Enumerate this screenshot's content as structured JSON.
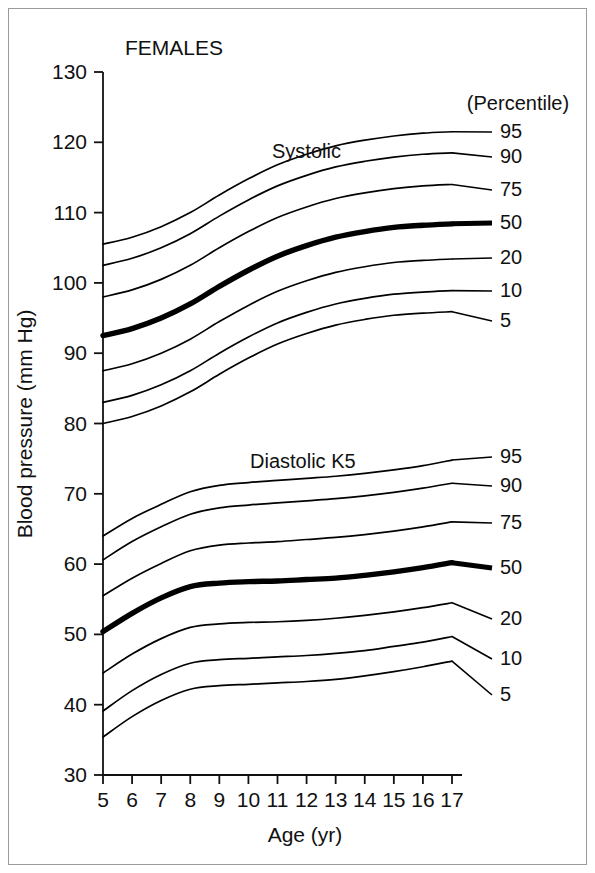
{
  "figure": {
    "panel_label": "FEMALES",
    "legend_title": "(Percentile)"
  },
  "axes": {
    "y_title": "Blood pressure (mm Hg)",
    "x_title": "Age (yr)",
    "y_ticks": [
      30,
      40,
      50,
      60,
      70,
      80,
      90,
      100,
      110,
      120,
      130
    ],
    "x_ticks": [
      5,
      6,
      7,
      8,
      9,
      10,
      11,
      12,
      13,
      14,
      15,
      16,
      17
    ],
    "ylim": [
      30,
      130
    ],
    "xlim": [
      5,
      17
    ],
    "grid": false
  },
  "chart_data": {
    "type": "line",
    "title": "FEMALES",
    "subtitle": "",
    "xlabel": "Age (yr)",
    "ylabel": "Blood pressure (mm Hg)",
    "xlim": [
      5,
      17
    ],
    "ylim": [
      30,
      130
    ],
    "grid": false,
    "legend_position": "right",
    "legend_title": "(Percentile)",
    "x": [
      5,
      6,
      7,
      8,
      9,
      10,
      11,
      12,
      13,
      14,
      15,
      16,
      17
    ],
    "groups": [
      {
        "name": "Systolic",
        "label": "Systolic",
        "series": [
          {
            "name": "95",
            "percentile": 95,
            "emphasis": false,
            "values": [
              105.5,
              106.5,
              108.0,
              110.0,
              112.5,
              114.8,
              116.8,
              118.3,
              119.5,
              120.3,
              120.9,
              121.3,
              121.5
            ]
          },
          {
            "name": "90",
            "percentile": 90,
            "emphasis": false,
            "values": [
              102.5,
              103.5,
              105.0,
              107.0,
              109.5,
              111.8,
              113.8,
              115.3,
              116.5,
              117.3,
              117.9,
              118.3,
              118.5
            ]
          },
          {
            "name": "75",
            "percentile": 75,
            "emphasis": false,
            "values": [
              98.0,
              99.0,
              100.5,
              102.5,
              105.0,
              107.3,
              109.3,
              110.8,
              112.0,
              112.8,
              113.4,
              113.8,
              114.0
            ]
          },
          {
            "name": "50",
            "percentile": 50,
            "emphasis": true,
            "values": [
              92.5,
              93.5,
              95.0,
              97.0,
              99.5,
              101.8,
              103.8,
              105.3,
              106.5,
              107.3,
              107.9,
              108.2,
              108.4
            ]
          },
          {
            "name": "20",
            "percentile": 20,
            "emphasis": false,
            "values": [
              87.5,
              88.5,
              90.0,
              92.0,
              94.5,
              96.8,
              98.8,
              100.3,
              101.5,
              102.3,
              102.9,
              103.2,
              103.4
            ]
          },
          {
            "name": "10",
            "percentile": 10,
            "emphasis": false,
            "values": [
              83.0,
              84.0,
              85.5,
              87.5,
              90.0,
              92.3,
              94.3,
              95.8,
              97.0,
              97.8,
              98.4,
              98.7,
              98.9
            ]
          },
          {
            "name": "5",
            "percentile": 5,
            "emphasis": false,
            "values": [
              80.0,
              81.0,
              82.5,
              84.5,
              87.0,
              89.3,
              91.3,
              92.8,
              94.0,
              94.8,
              95.4,
              95.7,
              95.9
            ]
          }
        ]
      },
      {
        "name": "Diastolic K5",
        "label": "Diastolic K5",
        "series": [
          {
            "name": "95",
            "percentile": 95,
            "emphasis": false,
            "values": [
              64.0,
              66.5,
              68.5,
              70.3,
              71.2,
              71.6,
              71.9,
              72.2,
              72.5,
              72.9,
              73.4,
              74.0,
              74.8
            ]
          },
          {
            "name": "90",
            "percentile": 90,
            "emphasis": false,
            "values": [
              60.6,
              63.2,
              65.3,
              67.1,
              68.0,
              68.4,
              68.7,
              69.0,
              69.3,
              69.7,
              70.2,
              70.8,
              71.5
            ]
          },
          {
            "name": "75",
            "percentile": 75,
            "emphasis": false,
            "values": [
              55.5,
              58.0,
              60.1,
              61.9,
              62.7,
              63.0,
              63.2,
              63.5,
              63.8,
              64.2,
              64.7,
              65.3,
              66.0
            ]
          },
          {
            "name": "50",
            "percentile": 50,
            "emphasis": true,
            "values": [
              50.4,
              53.0,
              55.2,
              56.8,
              57.3,
              57.5,
              57.6,
              57.8,
              58.0,
              58.4,
              58.9,
              59.5,
              60.2
            ]
          },
          {
            "name": "20",
            "percentile": 20,
            "emphasis": false,
            "values": [
              44.5,
              47.2,
              49.4,
              51.0,
              51.5,
              51.7,
              51.8,
              52.0,
              52.3,
              52.7,
              53.2,
              53.8,
              54.5
            ]
          },
          {
            "name": "10",
            "percentile": 10,
            "emphasis": false,
            "values": [
              39.1,
              42.0,
              44.3,
              45.9,
              46.4,
              46.6,
              46.8,
              47.0,
              47.3,
              47.7,
              48.3,
              48.9,
              49.7
            ]
          },
          {
            "name": "5",
            "percentile": 5,
            "emphasis": false,
            "values": [
              35.4,
              38.3,
              40.6,
              42.2,
              42.7,
              42.9,
              43.1,
              43.3,
              43.6,
              44.1,
              44.7,
              45.4,
              46.2
            ]
          }
        ]
      }
    ]
  },
  "legend": {
    "systolic_labels": [
      "95",
      "90",
      "75",
      "50",
      "20",
      "10",
      "5"
    ],
    "diastolic_labels": [
      "95",
      "90",
      "75",
      "50",
      "20",
      "10",
      "5"
    ]
  }
}
